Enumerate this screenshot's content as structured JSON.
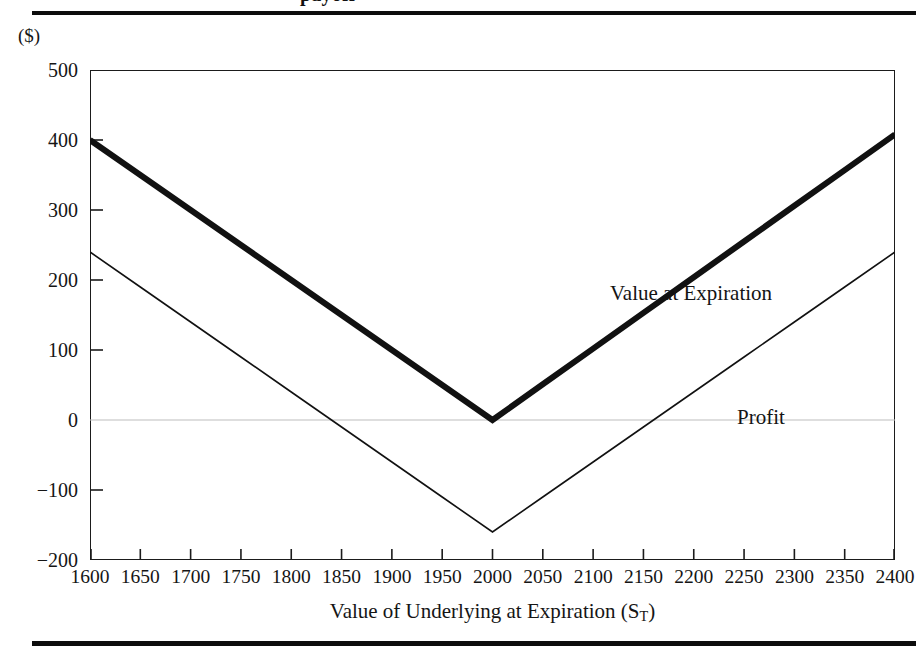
{
  "figure": {
    "truncated_caption": "payoff",
    "units_label": "($)",
    "top_rule": "horizontal-rule",
    "bottom_rule": "horizontal-rule"
  },
  "axes": {
    "x_title_main": "Value of Underlying at Expiration (S",
    "x_title_sub": "T",
    "x_title_close": ")",
    "y_ticks": [
      "500",
      "400",
      "300",
      "200",
      "100",
      "0",
      "−100",
      "−200"
    ],
    "x_ticks": [
      "1600",
      "1650",
      "1700",
      "1750",
      "1800",
      "1850",
      "1900",
      "1950",
      "2000",
      "2050",
      "2100",
      "2150",
      "2200",
      "2250",
      "2300",
      "2350",
      "2400"
    ]
  },
  "annotations": {
    "value_at_expiration": "Value at Expiration",
    "profit": "Profit"
  },
  "colors": {
    "line": "#111111",
    "frame": "#1b1b1b",
    "zero_gridline": "#bdbdbd",
    "background": "#ffffff"
  },
  "chart_data": {
    "type": "line",
    "title": "",
    "xlabel": "Value of Underlying at Expiration (S_T)",
    "ylabel": "($)",
    "xlim": [
      1600,
      2400
    ],
    "ylim": [
      -200,
      500
    ],
    "xtick_step": 50,
    "ytick_step": 100,
    "grid": false,
    "zero_gridline": true,
    "legend": "inline-annotations",
    "x": [
      1600,
      1650,
      1700,
      1750,
      1800,
      1850,
      1900,
      1950,
      2000,
      2050,
      2100,
      2150,
      2200,
      2250,
      2300,
      2350,
      2400
    ],
    "series": [
      {
        "name": "Value at Expiration",
        "style": "thick",
        "linewidth_px": 6,
        "color": "#111111",
        "values": [
          400,
          350,
          300,
          250,
          200,
          150,
          100,
          50,
          0,
          51,
          102,
          153,
          204,
          255,
          306,
          357,
          408
        ]
      },
      {
        "name": "Profit",
        "style": "thin",
        "linewidth_px": 1.6,
        "color": "#111111",
        "values": [
          240,
          190,
          140,
          90,
          40,
          -10,
          -60,
          -110,
          -160,
          -110,
          -60,
          -10,
          40,
          90,
          140,
          190,
          240
        ]
      }
    ],
    "notes": {
      "shape": "V-shaped straddle payoff, vertex at S_T = 2000",
      "value_at_expiration_vertex": 0,
      "profit_vertex": -160,
      "premium_paid": 160
    }
  }
}
